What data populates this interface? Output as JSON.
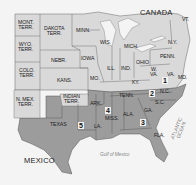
{
  "map": {
    "colors": {
      "background": "#f4f4f4",
      "water": "#ffffff",
      "union": "#d9d9d9",
      "confederate": "#9c9c9c",
      "border": "#555555"
    },
    "regions": {
      "canada": "CANADA",
      "mexico": "MEXICO",
      "gulf": "Gulf of Mexico",
      "atlantic": "ATLANTIC\nOCEAN"
    },
    "states": {
      "mont": "MONT.\nTERR.",
      "dakota": "DAKOTA\nTERR.",
      "minn": "MINN.",
      "wis": "WIS.",
      "mich": "MICH.",
      "ny": "N.Y.",
      "vt": "VT.",
      "wyo": "WYO.\nTERR.",
      "nebr": "NEBR.",
      "iowa": "IOWA",
      "ill": "ILL.",
      "ind": "IND.",
      "ohio": "OHIO",
      "penn": "PENN.",
      "colo": "COLO.\nTERR.",
      "kans": "KANS.",
      "mo": "MO.",
      "ky": "KY.",
      "wva": "W.\nVA.",
      "va": "VA.",
      "md": "MD.",
      "nmex": "N. MEX.\nTERR.",
      "indian": "INDIAN\nTERR.",
      "ark": "ARK.",
      "tenn": "TENN.",
      "nc": "N.C.",
      "sc": "S.C.",
      "texas": "TEXAS",
      "la": "LA.",
      "miss": "MISS.",
      "ala": "ALA.",
      "ga": "GA.",
      "fla": "FLA."
    },
    "districts": [
      "1",
      "2",
      "3",
      "4",
      "5"
    ]
  }
}
